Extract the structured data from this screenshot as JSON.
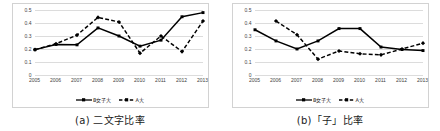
{
  "figure": {
    "panels": [
      {
        "caption": "(a) 二文字比率",
        "caption_index": "(a)",
        "legend": [
          {
            "label": "B女子大",
            "style": "solid",
            "color": "#000000"
          },
          {
            "label": "A大",
            "style": "dashed",
            "color": "#000000"
          }
        ],
        "chart_data": {
          "type": "line",
          "title": "",
          "xlabel": "",
          "ylabel": "",
          "categories": [
            "2005",
            "2006",
            "2007",
            "2008",
            "2009",
            "2010",
            "2011",
            "2012",
            "2013"
          ],
          "yticks": [
            "0",
            "0.1",
            "0.2",
            "0.3",
            "0.4",
            "0.5"
          ],
          "ylim": [
            0,
            0.5
          ],
          "grid": true,
          "legend_position": "bottom",
          "series": [
            {
              "name": "B女子大",
              "style": "solid",
              "marker": "square",
              "values": [
                0.195,
                0.235,
                0.232,
                0.362,
                0.3,
                0.222,
                0.268,
                0.448,
                0.48
              ]
            },
            {
              "name": "A大",
              "style": "dashed",
              "marker": "diamond",
              "values": [
                0.195,
                0.24,
                0.307,
                0.443,
                0.408,
                0.168,
                0.3,
                0.18,
                0.415
              ]
            }
          ]
        }
      },
      {
        "caption": "(b)「子」比率",
        "caption_index": "(b)",
        "legend": [
          {
            "label": "B女子大",
            "style": "solid",
            "color": "#000000"
          },
          {
            "label": "A大",
            "style": "dashed",
            "color": "#000000"
          }
        ],
        "chart_data": {
          "type": "line",
          "title": "",
          "xlabel": "",
          "ylabel": "",
          "categories": [
            "2005",
            "2006",
            "2007",
            "2008",
            "2009",
            "2010",
            "2011",
            "2012",
            "2013"
          ],
          "yticks": [
            "0",
            "0.1",
            "0.2",
            "0.3",
            "0.4",
            "0.5"
          ],
          "ylim": [
            0,
            0.5
          ],
          "grid": true,
          "legend_position": "bottom",
          "series": [
            {
              "name": "B女子大",
              "style": "solid",
              "marker": "square",
              "values": [
                0.348,
                0.262,
                0.2,
                0.262,
                0.357,
                0.357,
                0.215,
                0.196,
                0.188
              ]
            },
            {
              "name": "A大",
              "style": "dashed",
              "marker": "diamond",
              "values": [
                null,
                0.415,
                0.31,
                0.122,
                0.185,
                0.163,
                0.155,
                0.2,
                0.245
              ]
            }
          ]
        }
      }
    ]
  }
}
